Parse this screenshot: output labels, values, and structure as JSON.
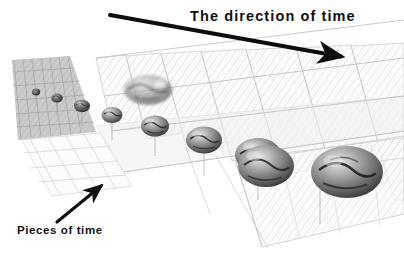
{
  "figure": {
    "width": 404,
    "height": 265,
    "background_color": "#ffffff",
    "style": "grayscale conceptual diagram",
    "caption_title": "The direction of time",
    "caption_secondary": "Pieces of time"
  },
  "labels": {
    "title": "The direction of time",
    "pieces": "Pieces of time"
  },
  "colors": {
    "text": "#111111",
    "arrow": "#0d0d0d",
    "plane_fill": "#f2f2f2",
    "plane_stroke": "#b9b9b9",
    "plane_hatch": "#dcdcdc",
    "far_haze": "#b7b7b7",
    "sphere_dark": "#3b3b3b",
    "sphere_light": "#cfcfcf",
    "stem": "#9a9a9a"
  },
  "arrows": [
    {
      "name": "direction-of-time-arrow",
      "label": "The direction of time",
      "x1": 110,
      "y1": 15,
      "x2": 347,
      "y2": 58,
      "thickness": 4,
      "head": "solid-triangle",
      "color": "#0d0d0d"
    },
    {
      "name": "pieces-of-time-arrow",
      "label": "Pieces of time",
      "x1": 57,
      "y1": 222,
      "x2": 106,
      "y2": 182,
      "thickness": 3,
      "head": "solid-triangle",
      "color": "#0d0d0d"
    }
  ],
  "planes": {
    "count": 11,
    "description": "Receding series of translucent hatched parallelogram sheets, each a slice of time",
    "items": [
      {
        "index": 0,
        "x": 22,
        "y": 58,
        "w": 15,
        "h": 52,
        "skew": -30,
        "opacity": 0.95,
        "gray": 0.72
      },
      {
        "index": 1,
        "x": 37,
        "y": 58,
        "w": 17,
        "h": 56,
        "skew": -30,
        "opacity": 0.93,
        "gray": 0.74
      },
      {
        "index": 2,
        "x": 54,
        "y": 58,
        "w": 20,
        "h": 60,
        "skew": -30,
        "opacity": 0.9,
        "gray": 0.77
      },
      {
        "index": 3,
        "x": 74,
        "y": 57,
        "w": 24,
        "h": 65,
        "skew": -30,
        "opacity": 0.86,
        "gray": 0.8
      },
      {
        "index": 4,
        "x": 98,
        "y": 56,
        "w": 28,
        "h": 71,
        "skew": -30,
        "opacity": 0.8,
        "gray": 0.83
      },
      {
        "index": 5,
        "x": 126,
        "y": 55,
        "w": 33,
        "h": 78,
        "skew": -30,
        "opacity": 0.72,
        "gray": 0.86
      },
      {
        "index": 6,
        "x": 159,
        "y": 54,
        "w": 38,
        "h": 86,
        "skew": -30,
        "opacity": 0.64,
        "gray": 0.89
      },
      {
        "index": 7,
        "x": 197,
        "y": 53,
        "w": 44,
        "h": 95,
        "skew": -30,
        "opacity": 0.56,
        "gray": 0.91
      },
      {
        "index": 8,
        "x": 241,
        "y": 52,
        "w": 51,
        "h": 106,
        "skew": -30,
        "opacity": 0.48,
        "gray": 0.93
      },
      {
        "index": 9,
        "x": 292,
        "y": 51,
        "w": 58,
        "h": 118,
        "skew": -30,
        "opacity": 0.42,
        "gray": 0.94
      },
      {
        "index": 10,
        "x": 350,
        "y": 50,
        "w": 64,
        "h": 130,
        "skew": -30,
        "opacity": 0.38,
        "gray": 0.95
      }
    ]
  },
  "spheres": {
    "count": 10,
    "description": "Grayscale Earth globes growing in size from far (upper-left) to near (lower-right)",
    "items": [
      {
        "index": 0,
        "cx": 36,
        "cy": 92,
        "r": 4.0,
        "stem": 10
      },
      {
        "index": 1,
        "cx": 57,
        "cy": 97,
        "r": 5.5,
        "stem": 13
      },
      {
        "index": 2,
        "cx": 82,
        "cy": 104,
        "r": 7.5,
        "stem": 16
      },
      {
        "index": 3,
        "cx": 112,
        "cy": 112,
        "r": 10.0,
        "stem": 20
      },
      {
        "index": 4,
        "cx": 148,
        "cy": 89,
        "r": 22.0,
        "stem": 0
      },
      {
        "index": 5,
        "cx": 155,
        "cy": 122,
        "r": 13.0,
        "stem": 24
      },
      {
        "index": 6,
        "cx": 204,
        "cy": 134,
        "r": 17.0,
        "stem": 28
      },
      {
        "index": 7,
        "cx": 258,
        "cy": 148,
        "r": 22.0,
        "stem": 32
      },
      {
        "index": 8,
        "cx": 320,
        "cy": 163,
        "r": 27.0,
        "stem": 36
      },
      {
        "index": 9,
        "cx": 347,
        "cy": 172,
        "r": 34.0,
        "stem": 0
      }
    ]
  }
}
